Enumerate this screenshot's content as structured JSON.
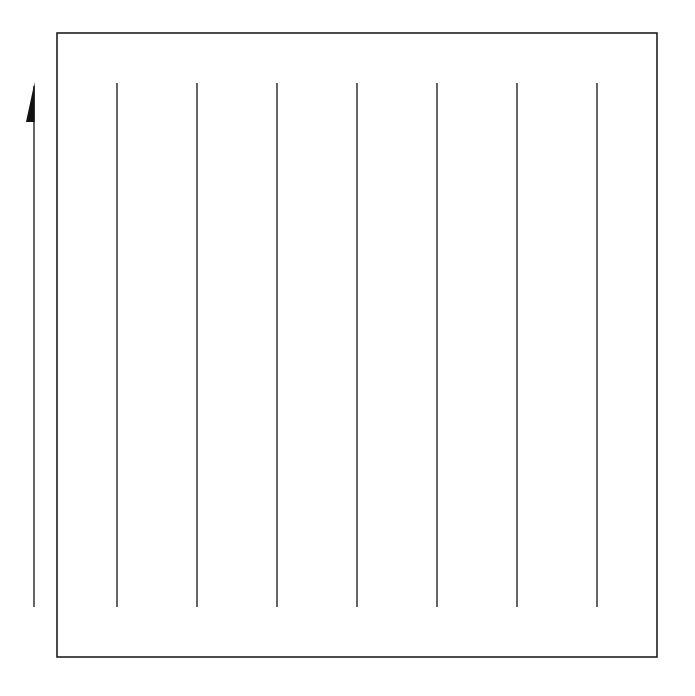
{
  "diagram": {
    "background": "#ffffff",
    "stroke_color": "#111111",
    "frame": {
      "x": 57,
      "y": 33,
      "width": 600,
      "height": 624,
      "stroke_width": 1.5
    },
    "vertical_lines": {
      "count": 7,
      "x_positions": [
        117,
        197,
        277,
        357,
        437,
        517,
        597
      ],
      "y_top": 83,
      "y_bottom": 607,
      "stroke_width": 1.3
    },
    "arrow": {
      "direction": "up",
      "style": "half-arrowhead-left",
      "x": 34,
      "y_tail": 607,
      "y_head": 82,
      "head_length": 40,
      "head_width": 8
    }
  }
}
